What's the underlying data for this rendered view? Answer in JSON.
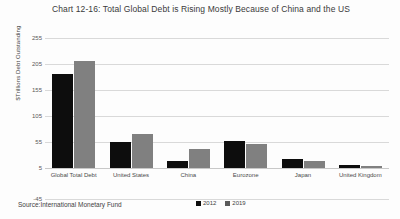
{
  "chart_data": {
    "type": "bar",
    "title": "Chart 12-16: Total Global Debt is Rising Mostly Because of China and the US",
    "xlabel": "",
    "ylabel": "$Trillions Debt Outstanding",
    "categories": [
      "Global Total Debt",
      "United States",
      "China",
      "Eurozone",
      "Japan",
      "United Kingdom"
    ],
    "series": [
      {
        "name": "2012",
        "color": "#0d0d0d",
        "values": [
          185,
          55,
          18,
          57,
          22,
          10
        ]
      },
      {
        "name": "2019",
        "color": "#808080",
        "values": [
          210,
          70,
          42,
          52,
          18,
          9
        ]
      }
    ],
    "ylim": [
      -45,
      255
    ],
    "yticks": [
      255,
      205,
      155,
      105,
      55,
      5,
      -45
    ],
    "grid": true,
    "legend_position": "bottom",
    "source": "Source:International Monetary Fund"
  }
}
